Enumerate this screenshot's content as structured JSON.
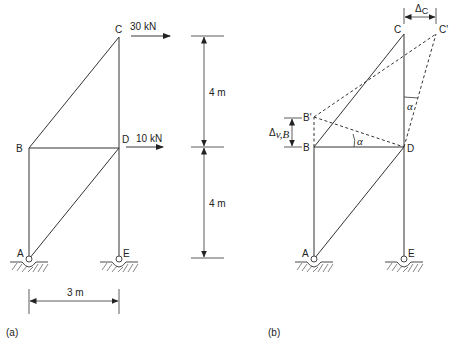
{
  "figure": {
    "panel_a": {
      "caption": "(a)",
      "nodes": {
        "A": {
          "label": "A",
          "x": 29,
          "y": 259
        },
        "B": {
          "label": "B",
          "x": 29,
          "y": 148
        },
        "C": {
          "label": "C",
          "x": 119,
          "y": 37
        },
        "D": {
          "label": "D",
          "x": 119,
          "y": 148
        },
        "E": {
          "label": "E",
          "x": 119,
          "y": 259
        }
      },
      "members": [
        "A-B",
        "B-D",
        "B-C",
        "C-D",
        "D-E",
        "A-D"
      ],
      "supports": [
        "A: pin",
        "E: pin"
      ],
      "loads": [
        {
          "node": "C",
          "label": "30 kN",
          "direction": "right"
        },
        {
          "node": "D",
          "label": "10 kN",
          "direction": "right"
        }
      ],
      "dimensions": {
        "upper_height": "4 m",
        "lower_height": "4 m",
        "width": "3 m"
      }
    },
    "panel_b": {
      "caption": "(b)",
      "nodes": {
        "A": {
          "label": "A"
        },
        "B": {
          "label": "B"
        },
        "C": {
          "label": "C"
        },
        "D": {
          "label": "D"
        },
        "E": {
          "label": "E"
        },
        "B_prime": {
          "label": "B'"
        },
        "C_prime": {
          "label": "C'"
        }
      },
      "annotations": {
        "delta_c": "Δ",
        "delta_c_sub": "C",
        "delta_vb": "Δ",
        "delta_vb_sub": "v,B",
        "angle_at_d": "α",
        "angle_at_cd": "α"
      }
    }
  }
}
